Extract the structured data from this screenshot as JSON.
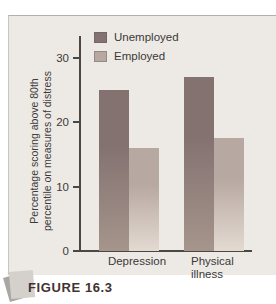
{
  "figure": {
    "caption": "FIGURE 16.3"
  },
  "chart_data": {
    "type": "bar",
    "title": "",
    "categories": [
      "Depression",
      "Physical illness"
    ],
    "series": [
      {
        "name": "Unemployed",
        "values": [
          25,
          27
        ],
        "color_top": "#837270",
        "color_bottom": "#a6958c"
      },
      {
        "name": "Employed",
        "values": [
          16,
          17.5
        ],
        "color_top": "#b7a8a1",
        "color_bottom": "#e3dad2"
      }
    ],
    "ylabel_line1": "Percentage scoring above 80th",
    "ylabel_line2": "percentile on measures of distress",
    "yticks": [
      30,
      20,
      10,
      0
    ],
    "ylim": [
      0,
      33
    ],
    "grid": false,
    "legend_position": "top-inside-left"
  },
  "colors": {
    "panel_background": "#edeae6",
    "axis": "#4a4744",
    "text": "#3b3937",
    "caption_text": "#433230"
  }
}
